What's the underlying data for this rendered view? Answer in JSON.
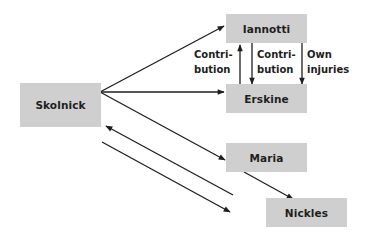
{
  "diagram": {
    "nodes": {
      "skolnick": {
        "label": "Skolnick",
        "x": 20,
        "y": 83,
        "w": 81,
        "h": 44
      },
      "iannotti": {
        "label": "Iannotti",
        "x": 226,
        "y": 14,
        "w": 81,
        "h": 29
      },
      "erskine": {
        "label": "Erskine",
        "x": 226,
        "y": 84,
        "w": 81,
        "h": 29
      },
      "maria": {
        "label": "Maria",
        "x": 226,
        "y": 143,
        "w": 81,
        "h": 29
      },
      "nickles": {
        "label": "Nickles",
        "x": 266,
        "y": 198,
        "w": 81,
        "h": 29
      }
    },
    "edge_labels": {
      "contribution_up": {
        "line1": "Contri-",
        "line2": "bution"
      },
      "contribution_down": {
        "line1": "Contri-",
        "line2": "bution"
      },
      "own_injuries": {
        "line1": "Own",
        "line2": "injuries"
      }
    },
    "edges": [
      {
        "from": "skolnick",
        "to": "iannotti",
        "direction": "forward"
      },
      {
        "from": "skolnick",
        "to": "erskine",
        "direction": "forward"
      },
      {
        "from": "skolnick",
        "to": "maria",
        "direction": "forward"
      },
      {
        "from": "erskine",
        "to": "iannotti",
        "label": "Contribution"
      },
      {
        "from": "iannotti",
        "to": "erskine",
        "label": "Contribution"
      },
      {
        "from": "iannotti",
        "to": "erskine",
        "label": "Own injuries"
      },
      {
        "from": "maria",
        "to": "nickles",
        "direction": "forward"
      },
      {
        "from": "nickles",
        "to": "skolnick",
        "direction": "forward"
      },
      {
        "from": "skolnick",
        "to": "nickles",
        "direction": "forward"
      }
    ],
    "colors": {
      "node_fill": "#cfcfcf",
      "line": "#1e1e1e",
      "text": "#1e1e1e"
    }
  }
}
